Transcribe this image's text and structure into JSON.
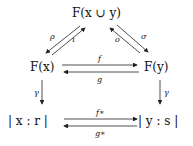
{
  "nodes": {
    "top": "F(x ∪ y)",
    "left": "F(x)",
    "right": "F(y)",
    "bottom_left": "| x : r |",
    "bottom_right": "| y : s |"
  },
  "labels": {
    "rho": "ρ",
    "iota": "ι",
    "omicron": "o",
    "sigma": "σ",
    "f": "f",
    "g": "g",
    "gamma_left": "γ",
    "gamma_right": "γ",
    "f_star": "f∗",
    "g_star": "g∗"
  }
}
